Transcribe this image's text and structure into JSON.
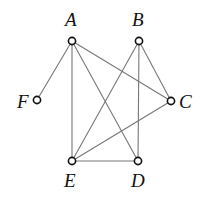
{
  "diagram": {
    "type": "undirected-graph",
    "nodes": [
      {
        "id": "A",
        "label": "A",
        "x": 72,
        "y": 41,
        "lx": 65,
        "ly": 26
      },
      {
        "id": "B",
        "label": "B",
        "x": 139,
        "y": 41,
        "lx": 132,
        "ly": 26
      },
      {
        "id": "C",
        "label": "C",
        "x": 171,
        "y": 101,
        "lx": 179,
        "ly": 108
      },
      {
        "id": "D",
        "label": "D",
        "x": 138,
        "y": 161,
        "lx": 131,
        "ly": 187
      },
      {
        "id": "E",
        "label": "E",
        "x": 72,
        "y": 161,
        "lx": 64,
        "ly": 187
      },
      {
        "id": "F",
        "label": "F",
        "x": 37,
        "y": 100,
        "lx": 17,
        "ly": 108
      }
    ],
    "edges": [
      [
        "A",
        "F"
      ],
      [
        "A",
        "E"
      ],
      [
        "A",
        "D"
      ],
      [
        "A",
        "C"
      ],
      [
        "B",
        "E"
      ],
      [
        "B",
        "D"
      ],
      [
        "B",
        "C"
      ],
      [
        "C",
        "E"
      ],
      [
        "E",
        "D"
      ]
    ]
  }
}
